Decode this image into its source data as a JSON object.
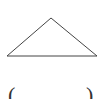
{
  "diagram": {
    "type": "triangle",
    "stroke_color": "#444444",
    "fill_color": "#ffffff",
    "vertices": {
      "apex": [
        51,
        18
      ],
      "base_left": [
        7,
        56
      ],
      "base_right": [
        97,
        56
      ]
    }
  },
  "answer_blank": {
    "left_paren": "(",
    "right_paren": ")"
  }
}
